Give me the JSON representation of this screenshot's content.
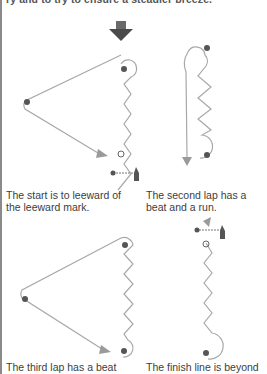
{
  "header": {
    "partial_text": "ry and to try to ensure a steadier breeze."
  },
  "panels": [
    {
      "id": "start",
      "caption_line1": "The start is to leeward of",
      "caption_line2": "the leeward mark."
    },
    {
      "id": "second-lap",
      "caption_line1": "The second lap has a",
      "caption_line2": "beat and a run."
    },
    {
      "id": "third-lap",
      "caption_line1": "The third lap has a beat",
      "caption_line2": ""
    },
    {
      "id": "finish",
      "caption_line1": "The finish line is beyond",
      "caption_line2": ""
    }
  ],
  "colors": {
    "course_line": "#a8a8a8",
    "mark": "#555555",
    "arrow": "#9a9a9a",
    "wind_arrow": "#505050",
    "border": "#8a8a8a"
  },
  "icons": [
    "wind-arrow-icon",
    "mark-icon",
    "committee-boat-icon",
    "start-buoy-icon",
    "course-arrow-icon"
  ]
}
